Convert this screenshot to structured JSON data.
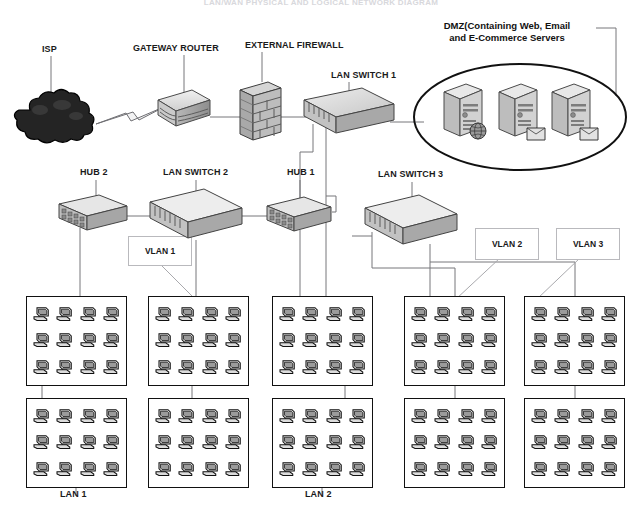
{
  "diagram": {
    "title": "LAN/WAN PHYSICAL AND LOGICAL NETWORK DIAGRAM",
    "background_color": "#ffffff",
    "line_color": "#6f6f73",
    "box_stroke": "#111111"
  },
  "labels": {
    "isp": "ISP",
    "gateway_router": "GATEWAY ROUTER",
    "external_firewall": "EXTERNAL FIREWALL",
    "lan_switch_1": "LAN SWITCH 1",
    "dmz": "DMZ(Containing Web, Email and E-Commerce Servers",
    "dmz_line1": "DMZ(Containing Web, Email",
    "dmz_line2": "and E-Commerce Servers",
    "hub_2": "HUB 2",
    "lan_switch_2": "LAN SWITCH 2",
    "hub_1": "HUB 1",
    "lan_switch_3": "LAN SWITCH 3",
    "vlan_1": "VLAN 1",
    "vlan_2": "VLAN 2",
    "vlan_3": "VLAN 3",
    "lan_1": "LAN 1",
    "lan_2": "LAN 2"
  },
  "devices": [
    {
      "id": "isp",
      "name": "ISP",
      "type": "cloud",
      "x": 14,
      "y": 92,
      "w": 74,
      "h": 52
    },
    {
      "id": "gateway-router",
      "name": "GATEWAY ROUTER",
      "type": "router",
      "x": 150,
      "y": 88,
      "w": 60,
      "h": 44
    },
    {
      "id": "external-firewall",
      "name": "EXTERNAL FIREWALL",
      "type": "firewall",
      "x": 238,
      "y": 80,
      "w": 40,
      "h": 60
    },
    {
      "id": "lan-switch-1",
      "name": "LAN SWITCH 1",
      "type": "switch",
      "x": 300,
      "y": 88,
      "w": 92,
      "h": 50
    },
    {
      "id": "hub-2",
      "name": "HUB 2",
      "type": "hub",
      "x": 57,
      "y": 193,
      "w": 72,
      "h": 42
    },
    {
      "id": "lan-switch-2",
      "name": "LAN SWITCH 2",
      "type": "switch",
      "x": 148,
      "y": 190,
      "w": 94,
      "h": 52
    },
    {
      "id": "hub-1",
      "name": "HUB 1",
      "type": "hub",
      "x": 265,
      "y": 196,
      "w": 66,
      "h": 40
    },
    {
      "id": "lan-switch-3",
      "name": "LAN SWITCH 3",
      "type": "switch",
      "x": 363,
      "y": 194,
      "w": 90,
      "h": 52
    }
  ],
  "dmz": {
    "label": "DMZ(Containing Web, Email and E-Commerce Servers",
    "ellipse": {
      "cx": 520,
      "cy": 117,
      "rx": 106,
      "ry": 53
    },
    "servers": [
      {
        "id": "web-server",
        "badge": "globe-icon",
        "x": 441,
        "y": 83
      },
      {
        "id": "email-server",
        "badge": "envelope-icon",
        "x": 496,
        "y": 83
      },
      {
        "id": "ecommerce-server",
        "badge": "envelope-icon",
        "x": 549,
        "y": 83
      }
    ]
  },
  "vlans": [
    {
      "id": "vlan-1",
      "label": "VLAN 1",
      "x": 128,
      "y": 236,
      "w": 62,
      "h": 28
    },
    {
      "id": "vlan-2",
      "label": "VLAN 2",
      "x": 475,
      "y": 228,
      "w": 62,
      "h": 30
    },
    {
      "id": "vlan-3",
      "label": "VLAN 3",
      "x": 556,
      "y": 228,
      "w": 62,
      "h": 30
    }
  ],
  "lan_clusters": {
    "columns": 5,
    "rows": 2,
    "pcs_per_box": 12,
    "pc_grid": {
      "cols": 4,
      "rows": 3
    },
    "boxes": [
      {
        "id": "cluster-r1c1",
        "x": 26,
        "y": 296,
        "w": 101,
        "h": 90
      },
      {
        "id": "cluster-r1c2",
        "x": 148,
        "y": 296,
        "w": 101,
        "h": 90
      },
      {
        "id": "cluster-r1c3",
        "x": 272,
        "y": 296,
        "w": 101,
        "h": 90
      },
      {
        "id": "cluster-r1c4",
        "x": 404,
        "y": 296,
        "w": 101,
        "h": 90
      },
      {
        "id": "cluster-r1c5",
        "x": 524,
        "y": 296,
        "w": 101,
        "h": 90
      },
      {
        "id": "cluster-r2c1",
        "x": 26,
        "y": 398,
        "w": 101,
        "h": 90
      },
      {
        "id": "cluster-r2c2",
        "x": 148,
        "y": 398,
        "w": 101,
        "h": 90
      },
      {
        "id": "cluster-r2c3",
        "x": 272,
        "y": 398,
        "w": 101,
        "h": 90
      },
      {
        "id": "cluster-r2c4",
        "x": 404,
        "y": 398,
        "w": 101,
        "h": 90
      },
      {
        "id": "cluster-r2c5",
        "x": 524,
        "y": 398,
        "w": 101,
        "h": 90
      }
    ]
  },
  "lan_labels": [
    {
      "id": "lan-1",
      "label": "LAN 1",
      "x": 60,
      "y": 490
    },
    {
      "id": "lan-2",
      "label": "LAN 2",
      "x": 305,
      "y": 490
    }
  ],
  "label_positions": {
    "isp": {
      "x": 42,
      "y": 44
    },
    "gateway_router": {
      "x": 133,
      "y": 43
    },
    "external_firewall": {
      "x": 245,
      "y": 40
    },
    "lan_switch_1": {
      "x": 331,
      "y": 70
    },
    "dmz": {
      "x": 417,
      "y": 22
    },
    "hub_2": {
      "x": 80,
      "y": 168
    },
    "lan_switch_2": {
      "x": 163,
      "y": 168
    },
    "hub_1": {
      "x": 287,
      "y": 168
    },
    "lan_switch_3": {
      "x": 378,
      "y": 170
    }
  }
}
